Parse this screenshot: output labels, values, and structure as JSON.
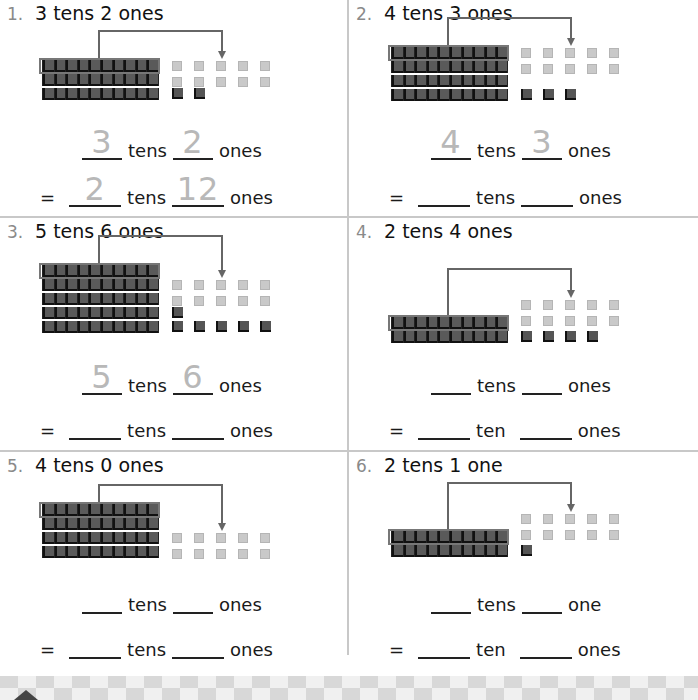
{
  "problems": [
    {
      "number": "1.",
      "title": "3 tens 2 ones",
      "tens_unit": "tens",
      "ones_unit": "ones",
      "tens_answer": "3",
      "ones_answer": "2",
      "regroup_label_tens": "tens",
      "regroup_label_ones": "ones",
      "regroup_tens_answer": "2",
      "regroup_ones_answer": "12",
      "equals": "=",
      "model": {
        "tens": 3,
        "ones": 2
      }
    },
    {
      "number": "2.",
      "title": "4 tens 3 ones",
      "tens_unit": "tens",
      "ones_unit": "ones",
      "tens_answer": "4",
      "ones_answer": "3",
      "regroup_label_tens": "tens",
      "regroup_label_ones": "ones",
      "regroup_tens_answer": "",
      "regroup_ones_answer": "",
      "equals": "=",
      "model": {
        "tens": 4,
        "ones": 3
      }
    },
    {
      "number": "3.",
      "title": "5 tens 6 ones",
      "tens_unit": "tens",
      "ones_unit": "ones",
      "tens_answer": "5",
      "ones_answer": "6",
      "regroup_label_tens": "tens",
      "regroup_label_ones": "ones",
      "regroup_tens_answer": "",
      "regroup_ones_answer": "",
      "equals": "=",
      "model": {
        "tens": 5,
        "ones": 6
      }
    },
    {
      "number": "4.",
      "title": "2 tens 4 ones",
      "tens_unit": "tens",
      "ones_unit": "ones",
      "tens_answer": "",
      "ones_answer": "",
      "regroup_label_tens": "ten",
      "regroup_label_ones": "ones",
      "regroup_tens_answer": "",
      "regroup_ones_answer": "",
      "equals": "=",
      "model": {
        "tens": 2,
        "ones": 4
      }
    },
    {
      "number": "5.",
      "title": "4 tens 0 ones",
      "tens_unit": "tens",
      "ones_unit": "ones",
      "tens_answer": "",
      "ones_answer": "",
      "regroup_label_tens": "tens",
      "regroup_label_ones": "ones",
      "regroup_tens_answer": "",
      "regroup_ones_answer": "",
      "equals": "=",
      "model": {
        "tens": 4,
        "ones": 0
      }
    },
    {
      "number": "6.",
      "title": "2 tens 1 one",
      "tens_unit": "tens",
      "ones_unit": "one",
      "tens_answer": "",
      "ones_answer": "",
      "regroup_label_tens": "ten",
      "regroup_label_ones": "ones",
      "regroup_tens_answer": "",
      "regroup_ones_answer": "",
      "equals": "=",
      "model": {
        "tens": 2,
        "ones": 1
      }
    }
  ]
}
